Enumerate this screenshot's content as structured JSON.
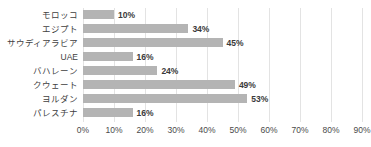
{
  "chart_data": {
    "type": "bar",
    "orientation": "horizontal",
    "title": "",
    "xlabel": "",
    "ylabel": "",
    "categories": [
      "モロッコ",
      "エジプト",
      "サウディアラビア",
      "UAE",
      "バハレーン",
      "クウェート",
      "ヨルダン",
      "パレスチナ"
    ],
    "values": [
      10,
      34,
      45,
      16,
      24,
      49,
      53,
      16
    ],
    "value_labels": [
      "10%",
      "34%",
      "45%",
      "16%",
      "24%",
      "49%",
      "53%",
      "16%"
    ],
    "xlim": [
      0,
      90
    ],
    "xticks": [
      0,
      10,
      20,
      30,
      40,
      50,
      60,
      70,
      80,
      90
    ],
    "xtick_labels": [
      "0%",
      "10%",
      "20%",
      "30%",
      "40%",
      "50%",
      "60%",
      "70%",
      "80%",
      "90%"
    ],
    "grid": "vertical",
    "legend": "none",
    "bar_color": "#b4b4b4",
    "gridline_color": "#e3e3e3",
    "label_color": "#3f3f3f"
  }
}
